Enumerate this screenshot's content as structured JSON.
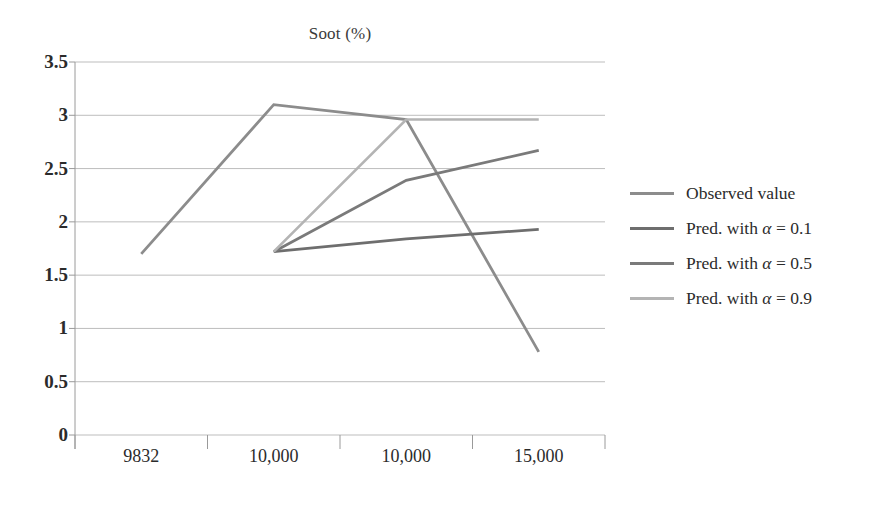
{
  "chart_data": {
    "type": "line",
    "title": "Soot (%)",
    "xlabel": "",
    "ylabel": "",
    "categories": [
      "9832",
      "10,000",
      "10,000",
      "15,000"
    ],
    "ylim": [
      0,
      3.5
    ],
    "ytick_values": [
      "0",
      "0.5",
      "1",
      "1.5",
      "2",
      "2.5",
      "3",
      "3.5"
    ],
    "grid": true,
    "legend_position": "right",
    "series": [
      {
        "name": "Observed value",
        "color": "#8c8c8c",
        "values": [
          1.7,
          3.1,
          2.96,
          0.78
        ]
      },
      {
        "name": "Pred. with α = 0.1",
        "color": "#6e6e6e",
        "values": [
          null,
          1.72,
          1.84,
          1.93
        ]
      },
      {
        "name": "Pred. with α = 0.5",
        "color": "#7a7a7a",
        "values": [
          null,
          1.72,
          2.39,
          2.67
        ]
      },
      {
        "name": "Pred. with α = 0.9",
        "color": "#b4b4b4",
        "values": [
          null,
          1.72,
          2.96,
          2.96
        ]
      }
    ]
  },
  "legend": {
    "items": [
      {
        "label": "Observed value",
        "color": "#8c8c8c"
      },
      {
        "label": "Pred. with α = 0.1",
        "color": "#6e6e6e"
      },
      {
        "label": "Pred. with α = 0.5",
        "color": "#7a7a7a"
      },
      {
        "label": "Pred. with α = 0.9",
        "color": "#b4b4b4"
      }
    ]
  },
  "axes": {
    "gridline_color": "#bdbdbd",
    "axis_color": "#9a9a9a"
  }
}
